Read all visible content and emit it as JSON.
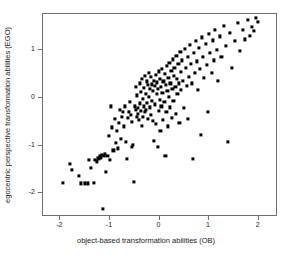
{
  "chart_data": {
    "type": "scatter",
    "title": "",
    "xlabel": "object-based transformation abilities (OB)",
    "ylabel": "egocentric perspective transformation abilities (EGO)",
    "xlim": [
      -2.35,
      2.35
    ],
    "ylim": [
      -2.45,
      1.75
    ],
    "xticks": [
      -2,
      -1,
      0,
      1,
      2
    ],
    "xticklabels": [
      "-2",
      "-1",
      "0",
      "1",
      "2"
    ],
    "yticks": [
      1,
      0,
      -1,
      -2
    ],
    "yticklabels": [
      "1",
      "0",
      "-1",
      "-2"
    ],
    "grid": false,
    "legend": null,
    "marker": "filled-square",
    "marker_color": "#000000",
    "frame_color": "#6e6e6e",
    "n_points": 185,
    "points": [
      [
        -1.95,
        -1.78
      ],
      [
        -1.8,
        -1.38
      ],
      [
        -1.77,
        -1.5
      ],
      [
        -1.62,
        -1.63
      ],
      [
        -1.58,
        -1.79
      ],
      [
        -1.5,
        -1.79
      ],
      [
        -1.44,
        -1.79
      ],
      [
        -1.42,
        -1.3
      ],
      [
        -1.38,
        -1.46
      ],
      [
        -1.33,
        -1.78
      ],
      [
        -1.3,
        -1.3
      ],
      [
        -1.27,
        -1.33
      ],
      [
        -1.24,
        -1.25
      ],
      [
        -1.22,
        -1.28
      ],
      [
        -1.2,
        -1.22
      ],
      [
        -1.18,
        -1.26
      ],
      [
        -1.16,
        -1.2
      ],
      [
        -1.14,
        -2.33
      ],
      [
        -1.12,
        -1.22
      ],
      [
        -1.1,
        -1.18
      ],
      [
        -1.08,
        -1.55
      ],
      [
        -1.05,
        -1.21
      ],
      [
        -1.02,
        -0.8
      ],
      [
        -1.0,
        -1.3
      ],
      [
        -0.98,
        -0.18
      ],
      [
        -0.96,
        -0.62
      ],
      [
        -0.93,
        -1.1
      ],
      [
        -0.9,
        -0.44
      ],
      [
        -0.88,
        -0.95
      ],
      [
        -0.86,
        -0.7
      ],
      [
        -0.84,
        -1.06
      ],
      [
        -0.82,
        -0.52
      ],
      [
        -0.8,
        -0.25
      ],
      [
        -0.78,
        -0.86
      ],
      [
        -0.76,
        -0.4
      ],
      [
        -0.74,
        -0.3
      ],
      [
        -0.72,
        -0.6
      ],
      [
        -0.7,
        -0.18
      ],
      [
        -0.68,
        -0.92
      ],
      [
        -0.66,
        -1.28
      ],
      [
        -0.64,
        -0.42
      ],
      [
        -0.62,
        -0.3
      ],
      [
        -0.6,
        -0.08
      ],
      [
        -0.58,
        -0.35
      ],
      [
        -0.56,
        -0.5
      ],
      [
        -0.55,
        -1.03
      ],
      [
        -0.53,
        -0.99
      ],
      [
        -0.52,
        -1.75
      ],
      [
        -0.5,
        -0.18
      ],
      [
        -0.48,
        0.22
      ],
      [
        -0.47,
        -0.26
      ],
      [
        -0.46,
        -0.4
      ],
      [
        -0.45,
        0.05
      ],
      [
        -0.44,
        -0.34
      ],
      [
        -0.43,
        -0.22
      ],
      [
        -0.42,
        -0.46
      ],
      [
        -0.4,
        0.3
      ],
      [
        -0.39,
        -0.12
      ],
      [
        -0.38,
        -0.28
      ],
      [
        -0.37,
        0.12
      ],
      [
        -0.36,
        -0.58
      ],
      [
        -0.35,
        0.4
      ],
      [
        -0.34,
        -0.02
      ],
      [
        -0.33,
        -0.4
      ],
      [
        -0.32,
        0.2
      ],
      [
        -0.31,
        -0.18
      ],
      [
        -0.3,
        0.46
      ],
      [
        -0.29,
        -0.3
      ],
      [
        -0.28,
        0.08
      ],
      [
        -0.27,
        -0.25
      ],
      [
        -0.26,
        0.34
      ],
      [
        -0.25,
        -0.1
      ],
      [
        -0.24,
        0.26
      ],
      [
        -0.23,
        -0.44
      ],
      [
        -0.22,
        0.02
      ],
      [
        -0.21,
        0.52
      ],
      [
        -0.2,
        -0.2
      ],
      [
        -0.19,
        0.18
      ],
      [
        -0.18,
        -0.36
      ],
      [
        -0.17,
        0.44
      ],
      [
        -0.16,
        -0.06
      ],
      [
        -0.15,
        0.28
      ],
      [
        -0.14,
        -0.48
      ],
      [
        -0.13,
        0.14
      ],
      [
        -0.12,
        0.36
      ],
      [
        -0.11,
        -0.9
      ],
      [
        -0.1,
        0.24
      ],
      [
        -0.09,
        -0.14
      ],
      [
        -0.08,
        0.48
      ],
      [
        -0.07,
        -0.55
      ],
      [
        -0.06,
        0.08
      ],
      [
        -0.05,
        0.32
      ],
      [
        -0.04,
        -1.02
      ],
      [
        -0.03,
        0.18
      ],
      [
        -0.02,
        -0.28
      ],
      [
        -0.01,
        0.55
      ],
      [
        0.0,
        -0.04
      ],
      [
        0.01,
        0.4
      ],
      [
        0.02,
        -0.7
      ],
      [
        0.03,
        0.22
      ],
      [
        0.04,
        -0.18
      ],
      [
        0.05,
        0.6
      ],
      [
        0.06,
        0.1
      ],
      [
        0.07,
        -0.46
      ],
      [
        0.08,
        0.34
      ],
      [
        0.1,
        -0.08
      ],
      [
        0.11,
        0.5
      ],
      [
        0.12,
        -1.22
      ],
      [
        0.13,
        0.26
      ],
      [
        0.14,
        -0.3
      ],
      [
        0.15,
        0.66
      ],
      [
        0.16,
        0.14
      ],
      [
        0.17,
        -0.6
      ],
      [
        0.18,
        0.42
      ],
      [
        0.19,
        0.02
      ],
      [
        0.2,
        0.72
      ],
      [
        0.21,
        -0.2
      ],
      [
        0.22,
        0.3
      ],
      [
        0.24,
        0.56
      ],
      [
        0.25,
        -0.42
      ],
      [
        0.26,
        0.18
      ],
      [
        0.27,
        0.8
      ],
      [
        0.28,
        -0.06
      ],
      [
        0.29,
        0.46
      ],
      [
        0.3,
        0.62
      ],
      [
        0.32,
        0.22
      ],
      [
        0.33,
        -0.34
      ],
      [
        0.34,
        0.88
      ],
      [
        0.35,
        0.4
      ],
      [
        0.36,
        0.08
      ],
      [
        0.38,
        0.7
      ],
      [
        0.39,
        0.3
      ],
      [
        0.4,
        -0.52
      ],
      [
        0.42,
        0.96
      ],
      [
        0.43,
        0.54
      ],
      [
        0.44,
        0.16
      ],
      [
        0.46,
        0.78
      ],
      [
        0.48,
        0.36
      ],
      [
        0.5,
        -0.22
      ],
      [
        0.52,
        1.02
      ],
      [
        0.54,
        0.62
      ],
      [
        0.55,
        0.24
      ],
      [
        0.57,
        0.86
      ],
      [
        0.58,
        -0.44
      ],
      [
        0.6,
        0.44
      ],
      [
        0.62,
        1.1
      ],
      [
        0.64,
        0.7
      ],
      [
        0.66,
        0.3
      ],
      [
        0.68,
        -1.28
      ],
      [
        0.7,
        0.94
      ],
      [
        0.72,
        0.52
      ],
      [
        0.74,
        1.18
      ],
      [
        0.76,
        0.76
      ],
      [
        0.78,
        0.16
      ],
      [
        0.8,
        1.04
      ],
      [
        0.82,
        0.6
      ],
      [
        0.84,
        -0.78
      ],
      [
        0.86,
        1.26
      ],
      [
        0.88,
        0.86
      ],
      [
        0.9,
        0.42
      ],
      [
        0.93,
        1.12
      ],
      [
        0.96,
        0.68
      ],
      [
        0.98,
        -0.3
      ],
      [
        1.0,
        1.34
      ],
      [
        1.02,
        0.94
      ],
      [
        1.05,
        0.52
      ],
      [
        1.08,
        1.2
      ],
      [
        1.1,
        0.78
      ],
      [
        1.12,
        1.42
      ],
      [
        1.15,
        1.0
      ],
      [
        1.18,
        0.36
      ],
      [
        1.22,
        1.28
      ],
      [
        1.25,
        0.86
      ],
      [
        1.3,
        1.5
      ],
      [
        1.34,
        1.08
      ],
      [
        1.38,
        -0.92
      ],
      [
        1.42,
        1.36
      ],
      [
        1.46,
        0.62
      ],
      [
        1.52,
        1.18
      ],
      [
        1.58,
        1.56
      ],
      [
        1.62,
        0.98
      ],
      [
        1.68,
        1.42
      ],
      [
        1.72,
        1.22
      ],
      [
        1.78,
        1.62
      ],
      [
        1.82,
        1.3
      ],
      [
        1.86,
        1.48
      ],
      [
        1.9,
        1.4
      ],
      [
        1.94,
        1.66
      ],
      [
        1.98,
        1.58
      ]
    ]
  }
}
